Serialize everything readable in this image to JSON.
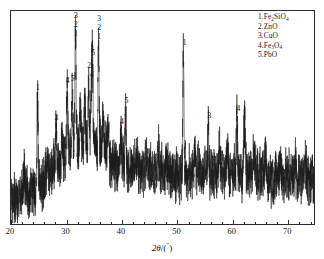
{
  "chart_data": {
    "type": "line",
    "title": "",
    "xlabel": "2θ/(°)",
    "ylabel": "",
    "xlim": [
      20,
      75
    ],
    "ylim": [
      0,
      100
    ],
    "grid": false,
    "xticks": [
      20,
      30,
      40,
      50,
      60,
      70
    ],
    "xticklabels": [
      "20",
      "30",
      "40",
      "50",
      "60",
      "70"
    ],
    "yticks": [],
    "yticklabels": [],
    "legend_position": "top-right",
    "series_name": "XRD intensity",
    "legend": [
      {
        "index": "1",
        "text": "1.Fe2SiO4",
        "formula_html": "1.Fe<sub>2</sub>SiO<sub>4</sub>"
      },
      {
        "index": "2",
        "text": "2.ZnO",
        "formula_html": "2.ZnO"
      },
      {
        "index": "3",
        "text": "3.CuO",
        "formula_html": "3.CuO"
      },
      {
        "index": "4",
        "text": "4.Fe3O4",
        "formula_html": "4.Fe<sub>3</sub>O<sub>4</sub>"
      },
      {
        "index": "5",
        "text": "5.PbO",
        "formula_html": "5.PbO"
      }
    ],
    "annotations": [
      {
        "labels": [
          "1"
        ],
        "two_theta": 24.8,
        "intensity": 60
      },
      {
        "labels": [
          "3"
        ],
        "two_theta": 28.2,
        "intensity": 46
      },
      {
        "labels": [
          "4"
        ],
        "two_theta": 30.2,
        "intensity": 63
      },
      {
        "labels": [
          "5"
        ],
        "two_theta": 31.1,
        "intensity": 64
      },
      {
        "labels": [
          "3",
          "2",
          "1"
        ],
        "two_theta": 31.7,
        "intensity": 97
      },
      {
        "labels": [
          "2"
        ],
        "two_theta": 34.1,
        "intensity": 70
      },
      {
        "labels": [
          "4"
        ],
        "two_theta": 34.6,
        "intensity": 66
      },
      {
        "labels": [
          "5"
        ],
        "two_theta": 34.8,
        "intensity": 76
      },
      {
        "labels": [
          "3",
          "2",
          "1"
        ],
        "two_theta": 35.9,
        "intensity": 84
      },
      {
        "labels": [
          "4"
        ],
        "two_theta": 40.0,
        "intensity": 44
      },
      {
        "labels": [
          "5"
        ],
        "two_theta": 40.8,
        "intensity": 54
      },
      {
        "labels": [
          "1"
        ],
        "two_theta": 51.3,
        "intensity": 81
      },
      {
        "labels": [
          "3"
        ],
        "two_theta": 55.8,
        "intensity": 47
      },
      {
        "labels": [
          "4"
        ],
        "two_theta": 61.0,
        "intensity": 50
      }
    ],
    "baseline_hump": {
      "description": "broad amorphous background rising from 20 deg, maximum near 34 deg, slowly decaying to 75 deg",
      "points": [
        {
          "two_theta": 20,
          "intensity": 10
        },
        {
          "two_theta": 24,
          "intensity": 16
        },
        {
          "two_theta": 28,
          "intensity": 26
        },
        {
          "two_theta": 31,
          "intensity": 34
        },
        {
          "two_theta": 34,
          "intensity": 38
        },
        {
          "two_theta": 36,
          "intensity": 36
        },
        {
          "two_theta": 39,
          "intensity": 28
        },
        {
          "two_theta": 44,
          "intensity": 25
        },
        {
          "two_theta": 50,
          "intensity": 24
        },
        {
          "two_theta": 56,
          "intensity": 24
        },
        {
          "two_theta": 62,
          "intensity": 24
        },
        {
          "two_theta": 68,
          "intensity": 22
        },
        {
          "two_theta": 75,
          "intensity": 21
        }
      ]
    },
    "noise_amplitude": 13,
    "line_color": "#1c1c1c",
    "frame_color": "#2b2b2b",
    "background_color": "#ffffff"
  }
}
